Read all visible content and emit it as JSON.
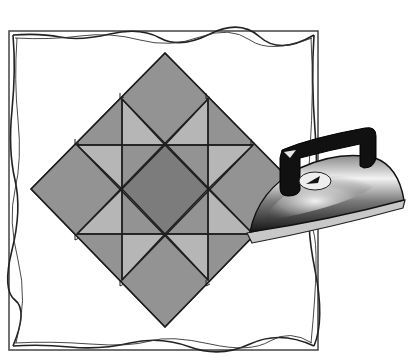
{
  "illustration": {
    "subject": "quilt block with clothes iron",
    "frame": {
      "style": "rough hand-drawn border",
      "color": "#333333"
    },
    "quilt": {
      "pattern": "Ohio star block set on point",
      "colors": {
        "dark": "#7c7c7c",
        "medium": "#939393",
        "light": "#b6b6b6",
        "line": "#1e1e1e"
      }
    },
    "iron": {
      "handle_color": "#111111",
      "body_gradient": [
        "#2a2a2a",
        "#f4f4f4",
        "#6e6e6e",
        "#1a1a1a"
      ],
      "soleplate_color": "#c8c8c8",
      "dial_color": "#eeeeee"
    }
  }
}
